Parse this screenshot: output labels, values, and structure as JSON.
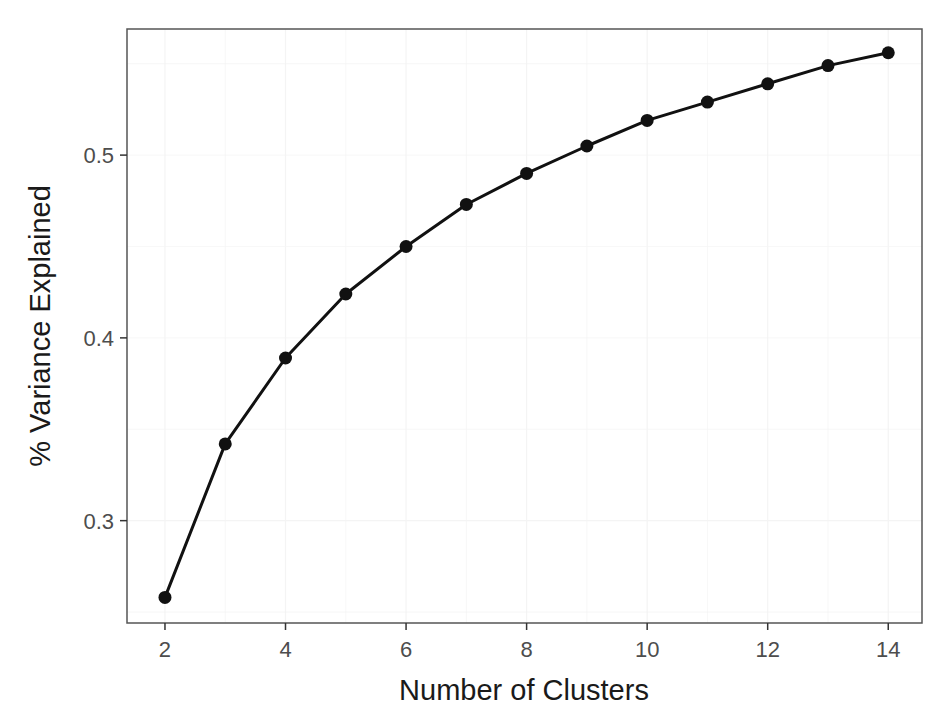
{
  "chart_data": {
    "type": "line",
    "title": "",
    "xlabel": "Number of Clusters",
    "ylabel": "% Variance Explained",
    "x": [
      2,
      3,
      4,
      5,
      6,
      7,
      8,
      9,
      10,
      11,
      12,
      13,
      14
    ],
    "series": [
      {
        "name": "Variance Explained",
        "values": [
          0.258,
          0.342,
          0.389,
          0.424,
          0.45,
          0.473,
          0.49,
          0.505,
          0.519,
          0.529,
          0.539,
          0.549,
          0.556
        ],
        "color": "#111111",
        "markers": true
      }
    ],
    "xticks": [
      2,
      4,
      6,
      8,
      10,
      12,
      14
    ],
    "xtick_labels": [
      "2",
      "4",
      "6",
      "8",
      "10",
      "12",
      "14"
    ],
    "yticks": [
      0.3,
      0.4,
      0.5
    ],
    "ytick_labels": [
      "0.3",
      "0.4",
      "0.5"
    ],
    "xlim": [
      1.37,
      14.56
    ],
    "ylim": [
      0.244,
      0.569
    ],
    "grid": true,
    "legend": null
  },
  "colors": {
    "line": "#111111",
    "panel_border": "#555555",
    "grid": "#f4f4f4",
    "tick_label": "#4d4d4d",
    "axis_title": "#1a1a1a"
  }
}
